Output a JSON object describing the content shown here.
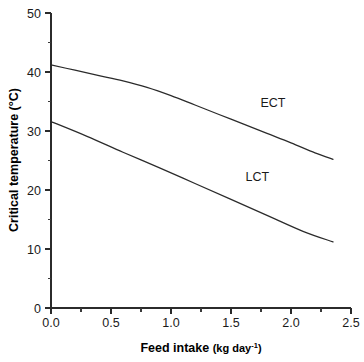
{
  "chart_data": {
    "type": "line",
    "title": "",
    "xlabel": "Feed intake (kg day-1)",
    "xlabel_main": "Feed intake",
    "xlabel_unit": "(kg day",
    "xlabel_unit_sup": "-1",
    "xlabel_unit_close": ")",
    "ylabel": "Critical temperature (°C)",
    "xlim": [
      0.0,
      2.5
    ],
    "ylim": [
      0,
      50
    ],
    "grid": false,
    "legend": "inline-annotations",
    "x_ticks": [
      "0.0",
      "0.5",
      "1.0",
      "1.5",
      "2.0",
      "2.5"
    ],
    "x_tick_values": [
      0.0,
      0.5,
      1.0,
      1.5,
      2.0,
      2.5
    ],
    "x_minor_tick_values": [
      0.25,
      0.75,
      1.25,
      1.75,
      2.25
    ],
    "y_ticks": [
      "0",
      "10",
      "20",
      "30",
      "40",
      "50"
    ],
    "y_tick_values": [
      0,
      10,
      20,
      30,
      40,
      50
    ],
    "y_minor_tick_values": [
      5,
      15,
      25,
      35,
      45
    ],
    "series": [
      {
        "name": "ECT",
        "label": "ECT",
        "label_x": 1.85,
        "label_y": 34.0,
        "x": [
          0.0,
          0.2,
          0.4,
          0.6,
          0.8,
          1.0,
          1.2,
          1.4,
          1.6,
          1.8,
          2.0,
          2.2,
          2.35
        ],
        "values": [
          41.2,
          40.3,
          39.4,
          38.5,
          37.4,
          36.0,
          34.4,
          32.8,
          31.2,
          29.6,
          28.0,
          26.3,
          25.2
        ]
      },
      {
        "name": "LCT",
        "label": "LCT",
        "label_x": 1.72,
        "label_y": 21.6,
        "x": [
          0.0,
          0.3,
          0.6,
          0.9,
          1.2,
          1.5,
          1.8,
          2.1,
          2.35
        ],
        "values": [
          31.6,
          29.1,
          26.4,
          23.8,
          21.1,
          18.4,
          15.7,
          13.0,
          11.2
        ]
      }
    ]
  },
  "colors": {
    "line": "#2b2b2b",
    "text": "#1a1a1a",
    "background": "#ffffff"
  }
}
